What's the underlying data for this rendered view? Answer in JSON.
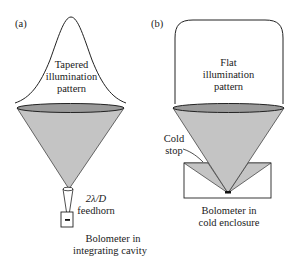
{
  "panels": [
    {
      "tag": "(a)",
      "pattern_label": [
        "Tapered",
        "illumination",
        "pattern"
      ],
      "feedhorn_label": {
        "math": "2λ/D",
        "text": "feedhorn"
      },
      "detector_label": [
        "Bolometer in",
        "integrating cavity"
      ]
    },
    {
      "tag": "(b)",
      "pattern_label": [
        "Flat",
        "illumination",
        "pattern"
      ],
      "stop_label": [
        "Cold",
        "stop"
      ],
      "detector_label": [
        "Bolometer in",
        "cold enclosure"
      ]
    }
  ],
  "colors": {
    "beam_fill": "#c4c4c4",
    "aperture_fill": "#9a9a9a",
    "stroke": "#222222"
  }
}
